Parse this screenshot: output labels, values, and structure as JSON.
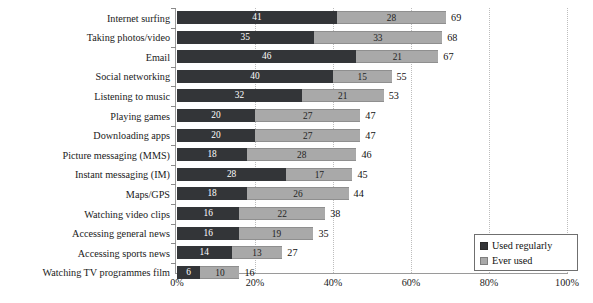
{
  "chart_data": {
    "type": "bar",
    "orientation": "horizontal",
    "stacked": true,
    "title": "",
    "subtitle": "",
    "xlabel": "",
    "ylabel": "",
    "xlim": [
      0,
      100
    ],
    "xticks": [
      0,
      20,
      40,
      60,
      80,
      100
    ],
    "xtick_labels": [
      "0%",
      "20%",
      "40%",
      "60%",
      "80%",
      "100%"
    ],
    "grid": "vertical-dotted",
    "legend_position": "lower-right",
    "categories": [
      "Internet surfing",
      "Taking photos/video",
      "Email",
      "Social networking",
      "Listening to music",
      "Playing games",
      "Downloading apps",
      "Picture messaging (MMS)",
      "Instant messaging (IM)",
      "Maps/GPS",
      "Watching video clips",
      "Accessing general news",
      "Accessing sports news",
      "Watching TV programmes film"
    ],
    "series": [
      {
        "name": "Used regularly",
        "color": "#333538",
        "values": [
          41,
          35,
          46,
          40,
          32,
          20,
          20,
          18,
          28,
          18,
          16,
          16,
          14,
          6
        ]
      },
      {
        "name": "Ever used",
        "color": "#a9a9a9",
        "values": [
          28,
          33,
          21,
          15,
          21,
          27,
          27,
          28,
          17,
          26,
          22,
          19,
          13,
          10
        ]
      }
    ],
    "totals": [
      69,
      68,
      67,
      55,
      53,
      47,
      47,
      46,
      45,
      44,
      38,
      35,
      27,
      16
    ]
  },
  "legend": {
    "items": [
      {
        "label": "Used regularly",
        "color": "#333538"
      },
      {
        "label": "Ever used",
        "color": "#a9a9a9"
      }
    ]
  },
  "colors": {
    "used_regularly": "#333538",
    "ever_used": "#a9a9a9",
    "axis": "#9a9a9a",
    "grid": "#bdbdbd",
    "background": "#ffffff"
  }
}
